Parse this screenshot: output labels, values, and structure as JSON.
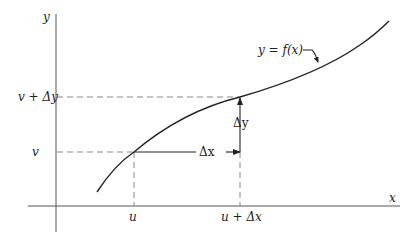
{
  "diagram": {
    "axes": {
      "x_label": "x",
      "y_label": "y"
    },
    "curve_label": "y = f(x)",
    "points": {
      "start": {
        "x_label": "u",
        "y_label": "v"
      },
      "end": {
        "x_label": "u + Δx",
        "y_label": "v + Δy"
      }
    },
    "increments": {
      "dx_label": "Δx",
      "dy_label": "Δy"
    }
  }
}
